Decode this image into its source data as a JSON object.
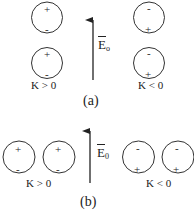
{
  "panels": [
    {
      "caption": "(a)",
      "field_label": "E",
      "field_sub": "o",
      "groups": [
        {
          "label": "K > 0",
          "top_sign": "+",
          "bottom_sign": "-"
        },
        {
          "label": "K < 0",
          "top_sign": "-",
          "bottom_sign": "+"
        }
      ]
    },
    {
      "caption": "(b)",
      "field_label": "E",
      "field_sub": "0",
      "groups": [
        {
          "label": "K > 0",
          "top_sign": "+",
          "bottom_sign": "-"
        },
        {
          "label": "K < 0",
          "top_sign": "-",
          "bottom_sign": "+"
        }
      ]
    }
  ],
  "colors": {
    "stroke": "#333333",
    "background": "#ffffff"
  }
}
